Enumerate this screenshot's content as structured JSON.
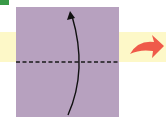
{
  "diagram": {
    "type": "origami-fold-step",
    "colors": {
      "paper": "#b7a1bf",
      "band": "#fdf8c8",
      "corner": "#3a9a48",
      "fold_line": "#1a1a1a",
      "fold_arrow": "#111111",
      "next_arrow": "#ef5a4a"
    },
    "elements": {
      "paper_square": "square sheet of paper",
      "valley_fold_line": "horizontal dashed valley fold",
      "fold_direction_arrow": "curved arrow folding bottom edge up",
      "next_step_arrow": "red arrow pointing to next step"
    }
  }
}
